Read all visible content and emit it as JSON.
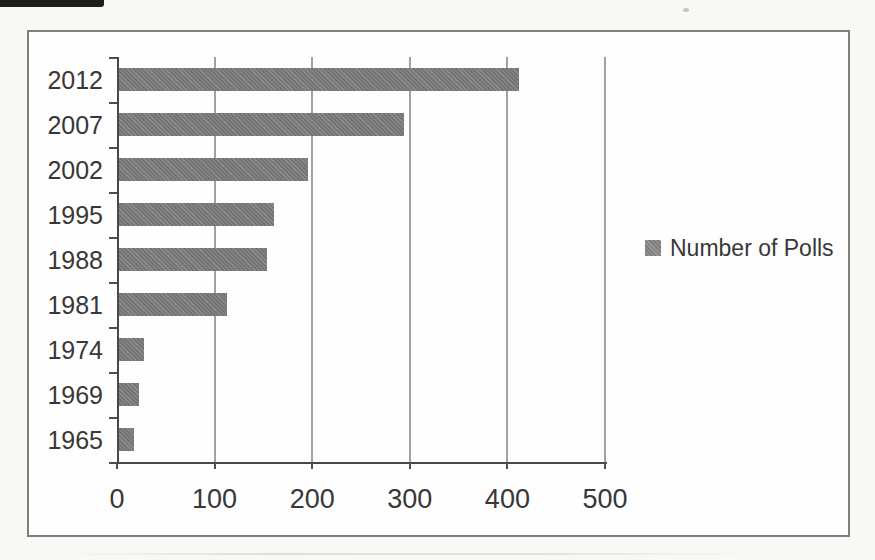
{
  "chart_data": {
    "type": "bar",
    "orientation": "horizontal",
    "title": "",
    "xlabel": "",
    "ylabel": "",
    "categories": [
      "2012",
      "2007",
      "2002",
      "1995",
      "1988",
      "1981",
      "1974",
      "1969",
      "1965"
    ],
    "values": [
      410,
      292,
      194,
      159,
      152,
      111,
      26,
      21,
      15
    ],
    "series_name": "Number of Polls",
    "x_ticks": [
      0,
      100,
      200,
      300,
      400,
      500
    ],
    "xlim": [
      0,
      500
    ],
    "grid": "vertical-gridlines",
    "legend_position": "center-right"
  },
  "colors": {
    "bar": "#7c7c7c",
    "gridline": "#a2a2a2",
    "axis": "#484848",
    "frame_border": "#7e7e7e",
    "plot_background": "#fefefe",
    "page_background": "#f8f8f5",
    "text": "#383838"
  },
  "legend": {
    "label": "Number of Polls"
  }
}
